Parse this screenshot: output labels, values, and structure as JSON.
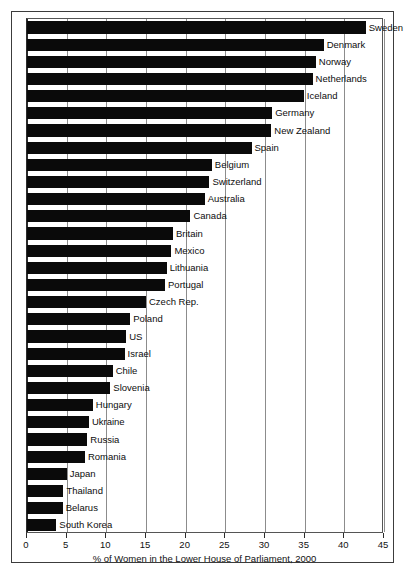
{
  "chart_data": {
    "type": "bar",
    "orientation": "horizontal",
    "title": "",
    "xlabel": "% of Women in the Lower House of Parliament, 2000",
    "ylabel": "",
    "xlim": [
      0,
      45
    ],
    "xticks": [
      0,
      5,
      10,
      15,
      20,
      25,
      30,
      35,
      40,
      45
    ],
    "xtick_labels": [
      "0",
      "5",
      "10",
      "15",
      "20",
      "25",
      "30",
      "35",
      "40",
      "45"
    ],
    "grid": true,
    "grid_axis": "x",
    "legend": false,
    "bar_color": "#0a0a0a",
    "categories": [
      "Sweden",
      "Denmark",
      "Norway",
      "Netherlands",
      "Iceland",
      "Germany",
      "New Zealand",
      "Spain",
      "Belgium",
      "Switzerland",
      "Australia",
      "Canada",
      "Britain",
      "Mexico",
      "Lithuania",
      "Portugal",
      "Czech Rep.",
      "Poland",
      "US",
      "Israel",
      "Chile",
      "Slovenia",
      "Hungary",
      "Ukraine",
      "Russia",
      "Romania",
      "Japan",
      "Thailand",
      "Belarus",
      "South Korea"
    ],
    "values": [
      42.7,
      37.4,
      36.4,
      36.0,
      34.9,
      30.9,
      30.8,
      28.3,
      23.3,
      23.0,
      22.4,
      20.6,
      18.4,
      18.2,
      17.6,
      17.4,
      15.0,
      13.0,
      12.5,
      12.3,
      10.8,
      10.5,
      8.3,
      7.8,
      7.6,
      7.3,
      5.0,
      4.6,
      4.5,
      3.7
    ],
    "annotations": [
      "Bar value labels are rendered as country names at the end of each bar."
    ]
  },
  "axis": {
    "x_title": "% of Women in the Lower House of Parliament, 2000"
  },
  "caption": {
    "clipped_text": ""
  }
}
